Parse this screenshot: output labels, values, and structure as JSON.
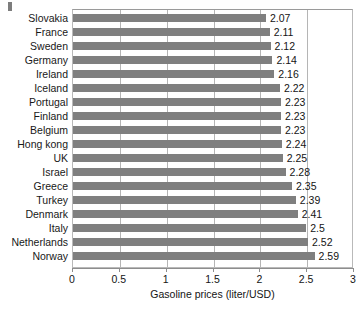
{
  "chart_data": {
    "type": "bar",
    "orientation": "horizontal",
    "title": "",
    "xlabel": "Gasoline prices (liter/USD)",
    "ylabel": "",
    "xlim": [
      0,
      3
    ],
    "xticks": [
      "0",
      "0.5",
      "1",
      "1.5",
      "2",
      "2.5",
      "3"
    ],
    "xtick_values": [
      0,
      0.5,
      1,
      1.5,
      2,
      2.5,
      3
    ],
    "grid": "vertical",
    "legend": "none",
    "bar_color": "#7f7f7f",
    "categories": [
      "Slovakia",
      "France",
      "Sweden",
      "Germany",
      "Ireland",
      "Iceland",
      "Portugal",
      "Finland",
      "Belgium",
      "Hong kong",
      "UK",
      "Israel",
      "Greece",
      "Turkey",
      "Denmark",
      "Italy",
      "Netherlands",
      "Norway"
    ],
    "values": [
      2.07,
      2.11,
      2.12,
      2.14,
      2.16,
      2.22,
      2.23,
      2.23,
      2.23,
      2.24,
      2.25,
      2.28,
      2.35,
      2.39,
      2.41,
      2.5,
      2.52,
      2.59
    ],
    "data_labels": [
      "2.07",
      "2.11",
      "2.12",
      "2.14",
      "2.16",
      "2.22",
      "2.23",
      "2.23",
      "2.23",
      "2.24",
      "2.25",
      "2.28",
      "2.35",
      "2.39",
      "2.41",
      "2.5",
      "2.52",
      "2.59"
    ]
  }
}
